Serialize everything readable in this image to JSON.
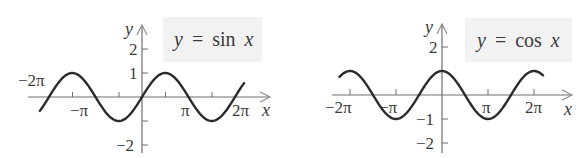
{
  "chart_data": [
    {
      "type": "line",
      "title": "y = sin x",
      "function": "sin",
      "xlabel": "x",
      "ylabel": "y",
      "xlim": [
        -6.6,
        6.9
      ],
      "ylim": [
        -2.2,
        2.4
      ],
      "x_tick_labels": [
        "−2π",
        "−π",
        "π",
        "2π"
      ],
      "x_tick_values": [
        -6.2832,
        -3.1416,
        3.1416,
        6.2832
      ],
      "x_minor_ticks_step": 1.5708,
      "y_tick_labels": [
        "2",
        "1",
        "−2"
      ],
      "y_tick_values": [
        2,
        1,
        -2
      ],
      "series": [
        {
          "name": "sin x",
          "x_range": [
            -6.9,
            6.9
          ],
          "amplitude": 1,
          "period": 6.2832
        }
      ],
      "grid": false,
      "legend": "none"
    },
    {
      "type": "line",
      "title": "y = cos x",
      "function": "cos",
      "xlabel": "x",
      "ylabel": "y",
      "xlim": [
        -6.9,
        6.9
      ],
      "ylim": [
        -2.2,
        2.4
      ],
      "x_tick_labels": [
        "−2π",
        "−π",
        "π",
        "2π"
      ],
      "x_tick_values": [
        -6.2832,
        -3.1416,
        3.1416,
        6.2832
      ],
      "y_tick_labels": [
        "2",
        "−1",
        "−2"
      ],
      "y_tick_values": [
        2,
        -1,
        -2
      ],
      "series": [
        {
          "name": "cos x",
          "x_range": [
            -7.0,
            6.9
          ],
          "amplitude": 1,
          "period": 6.2832
        }
      ],
      "grid": false,
      "legend": "none"
    }
  ],
  "sin_graph": {
    "label_y": "y",
    "label_eq": "=",
    "label_fn": "sin",
    "label_x": "x",
    "axis_x": "x",
    "axis_y": "y",
    "ticks": {
      "neg2pi": "−2π",
      "negpi": "−π",
      "pi": "π",
      "twopi": "2π",
      "y2": "2",
      "y1": "1",
      "yneg2": "−2"
    }
  },
  "cos_graph": {
    "label_y": "y",
    "label_eq": "=",
    "label_fn": "cos",
    "label_x": "x",
    "axis_x": "x",
    "axis_y": "y",
    "ticks": {
      "neg2pi": "−2π",
      "negpi": "−π",
      "pi": "π",
      "twopi": "2π",
      "y2": "2",
      "yneg1": "−1",
      "yneg2": "−2"
    }
  },
  "colors": {
    "curve": "#2b2b2b",
    "axis": "#6f6f6f",
    "label_box": "#f2f2f2",
    "text": "#3a3a3a"
  }
}
